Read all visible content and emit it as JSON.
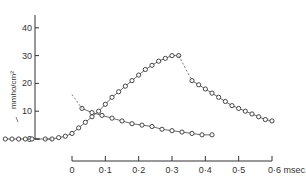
{
  "chart_data": {
    "type": "line",
    "title": "",
    "ylabel": "mmho/cm²",
    "xlabel": "msec.",
    "ylim": [
      0,
      45
    ],
    "xlim": [
      -0.2,
      0.6
    ],
    "y_ticks": [
      "0",
      "10",
      "20",
      "30",
      "40"
    ],
    "x_ticks": [
      "0",
      "0·1",
      "0·2",
      "0·3",
      "0·4",
      "0·5",
      "0·6 msec."
    ],
    "grid": false,
    "legend": "none",
    "series": [
      {
        "name": "rising phase",
        "x": [
          -0.2,
          -0.18,
          -0.16,
          -0.14,
          -0.12,
          -0.08,
          -0.06,
          -0.04,
          -0.02,
          0.0,
          0.02,
          0.04,
          0.06,
          0.08,
          0.1,
          0.12,
          0.14,
          0.16,
          0.18,
          0.2,
          0.22,
          0.24,
          0.26,
          0.28,
          0.3,
          0.32
        ],
        "values": [
          0,
          0,
          0,
          0,
          0,
          0,
          0,
          0.5,
          1,
          2,
          4,
          6,
          8,
          10,
          12.5,
          15,
          17,
          19,
          21,
          23,
          25,
          26.5,
          28,
          29,
          30,
          30
        ]
      },
      {
        "name": "decay from peak",
        "x": [
          0.36,
          0.38,
          0.4,
          0.42,
          0.44,
          0.46,
          0.48,
          0.5,
          0.52,
          0.54,
          0.56,
          0.58,
          0.6
        ],
        "values": [
          21,
          19.5,
          18,
          16.5,
          15,
          13.5,
          12,
          11,
          10,
          9,
          8,
          7,
          6.5
        ]
      },
      {
        "name": "decay from early break",
        "x": [
          0.03,
          0.06,
          0.09,
          0.12,
          0.15,
          0.18,
          0.21,
          0.24,
          0.27,
          0.3,
          0.33,
          0.36,
          0.39,
          0.42
        ],
        "values": [
          11,
          9.5,
          8.5,
          7.5,
          6.5,
          5.5,
          5,
          4.5,
          3.5,
          3,
          2.5,
          2,
          1.5,
          1.5
        ]
      }
    ]
  }
}
